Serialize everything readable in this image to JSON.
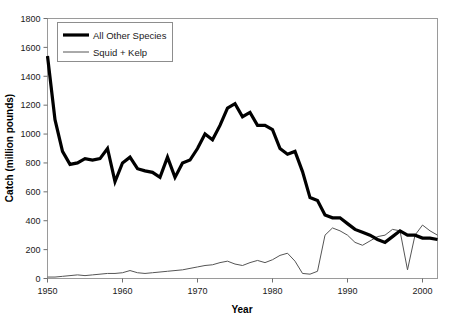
{
  "chart_data": {
    "type": "line",
    "title": "",
    "xlabel": "Year",
    "ylabel": "Catch (million pounds)",
    "xlim": [
      1950,
      2002
    ],
    "ylim": [
      0,
      1800
    ],
    "xticks": [
      1950,
      1960,
      1970,
      1980,
      1990,
      2000
    ],
    "xtick_labels": [
      "1950",
      "1960",
      "1970",
      "1980",
      "1990",
      "2000"
    ],
    "yticks": [
      0,
      200,
      400,
      600,
      800,
      1000,
      1200,
      1400,
      1600,
      1800
    ],
    "ytick_labels": [
      "0",
      "200",
      "400",
      "600",
      "800",
      "1000",
      "1200",
      "1400",
      "1600",
      "1800"
    ],
    "grid": false,
    "legend_position": "upper-left",
    "legend_entries": [
      "All Other Species",
      "Squid + Kelp"
    ],
    "x": [
      1950,
      1951,
      1952,
      1953,
      1954,
      1955,
      1956,
      1957,
      1958,
      1959,
      1960,
      1961,
      1962,
      1963,
      1964,
      1965,
      1966,
      1967,
      1968,
      1969,
      1970,
      1971,
      1972,
      1973,
      1974,
      1975,
      1976,
      1977,
      1978,
      1979,
      1980,
      1981,
      1982,
      1983,
      1984,
      1985,
      1986,
      1987,
      1988,
      1989,
      1990,
      1991,
      1992,
      1993,
      1994,
      1995,
      1996,
      1997,
      1998,
      1999,
      2000,
      2001,
      2002
    ],
    "series": [
      {
        "name": "All Other Species",
        "color": "#000000",
        "linewidth": 3.2,
        "values": [
          1540,
          1100,
          880,
          790,
          800,
          830,
          820,
          830,
          900,
          670,
          800,
          840,
          760,
          745,
          735,
          700,
          840,
          700,
          800,
          820,
          900,
          1000,
          960,
          1060,
          1180,
          1210,
          1120,
          1150,
          1060,
          1060,
          1030,
          900,
          860,
          880,
          740,
          560,
          540,
          440,
          420,
          420,
          380,
          340,
          320,
          300,
          270,
          250,
          290,
          330,
          300,
          300,
          280,
          280,
          270
        ]
      },
      {
        "name": "Squid + Kelp",
        "color": "#555555",
        "linewidth": 1.0,
        "values": [
          10,
          10,
          15,
          20,
          25,
          20,
          25,
          30,
          35,
          35,
          40,
          55,
          40,
          35,
          40,
          45,
          50,
          55,
          60,
          70,
          80,
          90,
          95,
          110,
          120,
          100,
          90,
          110,
          125,
          110,
          130,
          160,
          175,
          120,
          35,
          30,
          50,
          300,
          350,
          330,
          300,
          250,
          230,
          260,
          290,
          300,
          340,
          330,
          60,
          300,
          370,
          330,
          300
        ]
      }
    ]
  },
  "axis": {
    "xlabel": "Year",
    "ylabel": "Catch (million pounds)"
  },
  "legend": {
    "items": [
      {
        "label": "All Other Species",
        "style": "thick"
      },
      {
        "label": "Squid + Kelp",
        "style": "thin"
      }
    ]
  },
  "colors": {
    "all_other_species": "#000000",
    "squid_kelp": "#555555",
    "frame": "#9a9a9a",
    "text": "#1a1a1a"
  }
}
